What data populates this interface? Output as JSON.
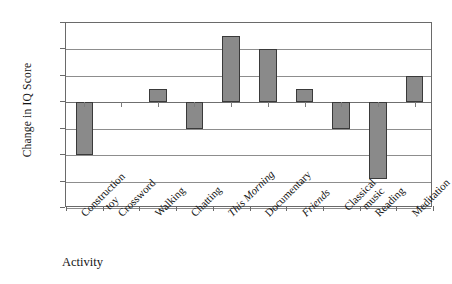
{
  "chart_data": {
    "type": "bar",
    "title": "",
    "xlabel": "Activity",
    "ylabel": "Change in IQ Score",
    "ylim": [
      -8,
      6
    ],
    "ytick_step": 2,
    "yticks": [
      6,
      4,
      2,
      0,
      -2,
      -4,
      -6,
      -8
    ],
    "grid": true,
    "legend": "none",
    "categories": [
      "Construction toy",
      "Crossword",
      "Walking",
      "Chatting",
      "This Morning",
      "Documentary",
      "Friends",
      "Classical music",
      "Reading",
      "Meditation"
    ],
    "category_lines": [
      [
        "Construction",
        "toy"
      ],
      [
        "Crossword"
      ],
      [
        "Walking"
      ],
      [
        "Chatting"
      ],
      [
        "This Morning"
      ],
      [
        "Documentary"
      ],
      [
        "Friends"
      ],
      [
        "Classical",
        "music"
      ],
      [
        "Reading"
      ],
      [
        "Meditation"
      ]
    ],
    "category_italic": [
      false,
      false,
      false,
      false,
      true,
      false,
      true,
      false,
      false,
      false
    ],
    "values": [
      -4,
      0,
      1,
      -2,
      5,
      4,
      1,
      -2,
      -5.8,
      2
    ],
    "bar_color": "#8a8a8a",
    "bar_border_color": "#3a3a3a",
    "axis_color": "#6a6a6a",
    "gridline_color": "#8d8d8d"
  }
}
